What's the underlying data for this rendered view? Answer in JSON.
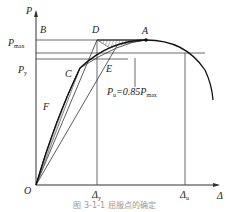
{
  "diagram": {
    "axes": {
      "y_label": "P",
      "x_label": "Δ",
      "origin": "O"
    },
    "y_ticks": {
      "pmax": "P",
      "pmax_sub": "max",
      "py": "P",
      "py_sub": "y"
    },
    "x_ticks": {
      "dy": "Δ",
      "dy_sub": "y",
      "du": "Δ",
      "du_sub": "u"
    },
    "points": {
      "A": "A",
      "B": "B",
      "C": "C",
      "D": "D",
      "E": "E",
      "F": "F"
    },
    "annotation": {
      "pre": "P",
      "sub": "u",
      "mid": "=0.85P",
      "sub2": "max"
    },
    "caption": "图 3-1-1  屈服点的确定"
  }
}
